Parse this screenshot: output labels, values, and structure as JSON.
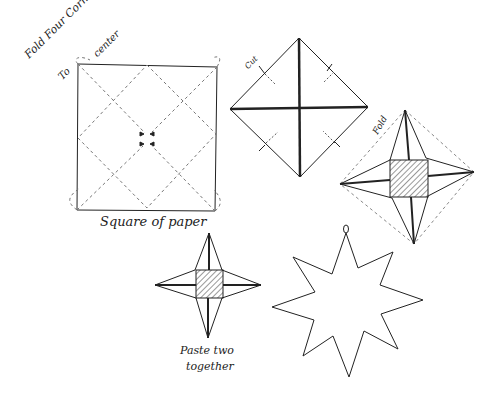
{
  "diagram": {
    "type": "instructional-sketch",
    "colors": {
      "ink": "#222222",
      "dashed": "#777777",
      "background": "#ffffff"
    },
    "steps": [
      {
        "id": "square",
        "label_top": "Fold Four Corners",
        "label_top2": "To",
        "label_top3": "center",
        "label_bottom": "Square of paper"
      },
      {
        "id": "diamond-cut",
        "label": "Cut"
      },
      {
        "id": "folded-star",
        "label": "Fold"
      },
      {
        "id": "four-point-star",
        "label_line1": "Paste two",
        "label_line2": "together"
      },
      {
        "id": "eight-point-star",
        "label": ""
      }
    ]
  }
}
